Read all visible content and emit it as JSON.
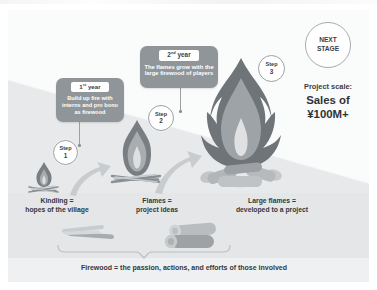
{
  "diagram": {
    "title_hidden": "",
    "callouts": [
      {
        "id": "callout-year-1",
        "year_prefix": "1",
        "year_sup": "st",
        "year_suffix": " year",
        "body": "Build up fire with interns and pro bono as firewood"
      },
      {
        "id": "callout-year-2",
        "year_prefix": "2",
        "year_sup": "nd",
        "year_suffix": " year",
        "body": "The flames grow with the large firewood of players"
      }
    ],
    "steps": [
      {
        "word": "Step",
        "number": "1"
      },
      {
        "word": "Step",
        "number": "2"
      },
      {
        "word": "Step",
        "number": "3"
      }
    ],
    "stage_badge": {
      "line1": "NEXT",
      "line2": "STAGE"
    },
    "scale": {
      "label": "Project scale:",
      "value": "Sales of ¥100M+"
    },
    "captions": [
      {
        "line1": "Kindling =",
        "line2": "hopes of the village"
      },
      {
        "line1": "Flames =",
        "line2": "project ideas"
      },
      {
        "line1": "Large flames =",
        "line2": "developed to a project"
      }
    ],
    "footer": "Firewood = the passion, actions, and efforts of those involved",
    "colors": {
      "callout_bg": "#8f9599",
      "callout_text": "#ffffff",
      "badge_border": "#9aa0a4",
      "text_dark": "#33383c",
      "flame_outer": "#6f7478",
      "flame_mid": "#9ea3a7",
      "flame_inner": "#d9dcde",
      "log_light": "#c9ccce",
      "log_dark": "#8d9295",
      "arrow": "#c3c7ca",
      "bg_light": "#fafbfb",
      "bg_shade": "#e7e9ea"
    }
  }
}
